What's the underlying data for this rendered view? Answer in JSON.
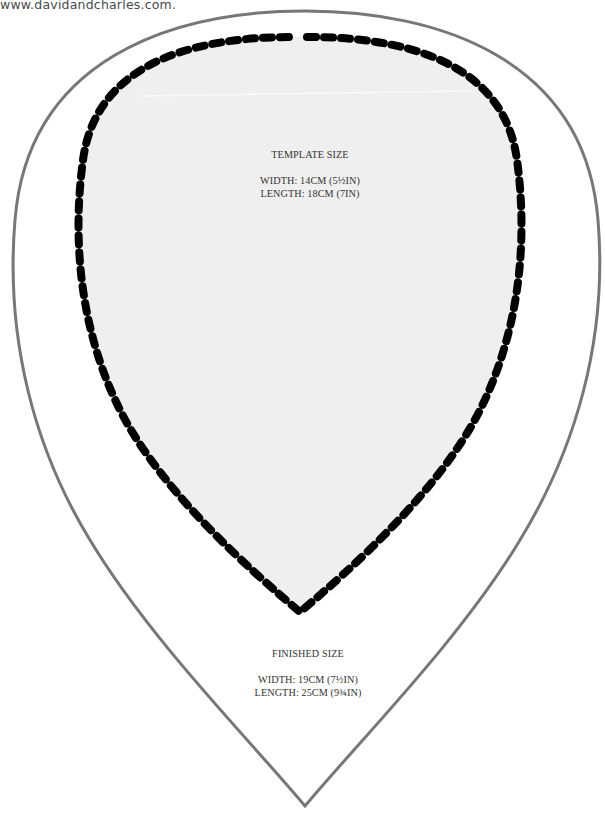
{
  "header": {
    "source_url": "www.davidandcharles.com."
  },
  "template": {
    "title": "TEMPLATE SIZE",
    "width": "WIDTH: 14CM (5½IN)",
    "length": "LENGTH: 18CM (7IN)"
  },
  "finished": {
    "title": "FINISHED SIZE",
    "width": "WIDTH: 19CM (7½IN)",
    "length": "LENGTH: 25CM (9¾IN)"
  },
  "colors": {
    "outer_outline": "#777777",
    "stitch_line": "#000000",
    "template_fill": "#efefef",
    "text": "#333333"
  }
}
